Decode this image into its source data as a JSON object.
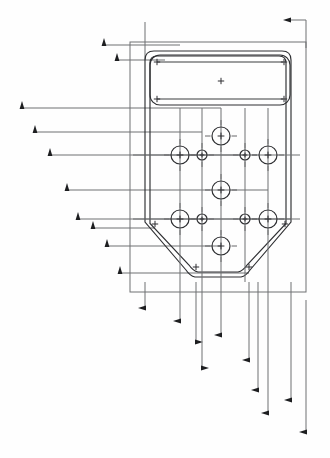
{
  "drawing": {
    "title": "Mounting Plate Hole Pattern Detail",
    "type": "mechanical-engineering-drawing",
    "view": "plan-view",
    "background_color": "#fefefe",
    "line_color": "#6f7073",
    "part_outline_color": "#2e2f32",
    "arrow_color": "#1d1e20",
    "canvas": {
      "width": 330,
      "height": 458
    }
  },
  "part": {
    "name": "tapered-mounting-plate",
    "outer_boundary": {
      "name": "outer-reference-rectangle",
      "x": 130,
      "y": 42,
      "width": 176,
      "height": 250
    },
    "plate_outline": {
      "name": "plate-profile",
      "description": "rounded-top rectangle with chamfered lower corners",
      "top": 51,
      "bottom": 281,
      "left": 145,
      "right": 291,
      "corner_radius": 9,
      "chamfer_start_y": 222,
      "chamfer_bottom_y": 272,
      "chamfer_inset": 45
    },
    "inner_offset_outline": {
      "name": "plate-inner-offset-profile",
      "offset": 5
    }
  },
  "features": {
    "top_slot": {
      "name": "top-rounded-slot",
      "x": 150,
      "y": 55,
      "width": 140,
      "height": 50,
      "corner_radius": 10,
      "inner_line_top_y": 62,
      "inner_line_bottom_y": 99,
      "corner_marks": 4,
      "center_mark": true
    },
    "large_holes": [
      {
        "name": "hole-top-center",
        "cx": 221,
        "cy": 136,
        "r": 9
      },
      {
        "name": "hole-mid-left",
        "cx": 180,
        "cy": 155,
        "r": 9
      },
      {
        "name": "hole-mid-right",
        "cx": 268,
        "cy": 155,
        "r": 9
      },
      {
        "name": "hole-center",
        "cx": 221,
        "cy": 190,
        "r": 9
      },
      {
        "name": "hole-low-left",
        "cx": 180,
        "cy": 219,
        "r": 9
      },
      {
        "name": "hole-low-right",
        "cx": 268,
        "cy": 219,
        "r": 9
      },
      {
        "name": "hole-bottom-center",
        "cx": 221,
        "cy": 246,
        "r": 9
      }
    ],
    "small_holes": [
      {
        "name": "small-hole-mid-left",
        "cx": 202,
        "cy": 155,
        "r": 5
      },
      {
        "name": "small-hole-mid-right",
        "cx": 245,
        "cy": 155,
        "r": 5
      },
      {
        "name": "small-hole-low-left",
        "cx": 202,
        "cy": 219,
        "r": 5
      },
      {
        "name": "small-hole-low-right",
        "cx": 245,
        "cy": 219,
        "r": 5
      }
    ],
    "corner_cross_marks": [
      {
        "name": "cross-slot-tl",
        "x": 157,
        "y": 62
      },
      {
        "name": "cross-slot-tr",
        "x": 284,
        "y": 62
      },
      {
        "name": "cross-slot-c",
        "x": 221,
        "y": 81
      },
      {
        "name": "cross-slot-bl",
        "x": 157,
        "y": 99
      },
      {
        "name": "cross-slot-br",
        "x": 284,
        "y": 99
      },
      {
        "name": "cross-plate-ml",
        "x": 155,
        "y": 224
      },
      {
        "name": "cross-plate-mr",
        "x": 285,
        "y": 224
      },
      {
        "name": "cross-plate-bl",
        "x": 196,
        "y": 267
      },
      {
        "name": "cross-plate-br",
        "x": 249,
        "y": 267
      }
    ]
  },
  "dimensions": {
    "vertical_stack_left": {
      "name": "left-vertical-dimension-lines",
      "description": "horizontal leader lines terminating in upward arrowheads, stacked top to bottom",
      "lines": [
        {
          "name": "dim-v-1",
          "arrow_x": 104,
          "y": 45,
          "to_x": 180
        },
        {
          "name": "dim-v-2",
          "arrow_x": 117,
          "y": 60,
          "to_x": 165
        },
        {
          "name": "dim-v-3",
          "arrow_x": 22,
          "y": 108,
          "to_x": 221
        },
        {
          "name": "dim-v-4",
          "arrow_x": 35,
          "y": 132,
          "to_x": 202
        },
        {
          "name": "dim-v-5",
          "arrow_x": 50,
          "y": 155,
          "to_x": 245
        },
        {
          "name": "dim-v-6",
          "arrow_x": 67,
          "y": 190,
          "to_x": 268
        },
        {
          "name": "dim-v-7",
          "arrow_x": 78,
          "y": 219,
          "to_x": 291
        },
        {
          "name": "dim-v-8",
          "arrow_x": 93,
          "y": 228,
          "to_x": 155
        },
        {
          "name": "dim-v-9",
          "arrow_x": 107,
          "y": 246,
          "to_x": 221
        },
        {
          "name": "dim-v-10",
          "arrow_x": 120,
          "y": 273,
          "to_x": 249
        }
      ]
    },
    "horizontal_stack_bottom": {
      "name": "bottom-horizontal-dimension-lines",
      "description": "vertical leader lines terminating in leftward/rightward arrowheads, stepped down",
      "lines": [
        {
          "name": "dim-h-1",
          "x": 145,
          "arrow_y": 308,
          "from_y": 282,
          "dir": "left"
        },
        {
          "name": "dim-h-2",
          "x": 180,
          "arrow_y": 321,
          "from_y": 282,
          "dir": "left"
        },
        {
          "name": "dim-h-3",
          "x": 196,
          "arrow_y": 342,
          "from_y": 282,
          "dir": "right"
        },
        {
          "name": "dim-h-4",
          "x": 221,
          "arrow_y": 335,
          "from_y": 282,
          "dir": "left"
        },
        {
          "name": "dim-h-5",
          "x": 202,
          "arrow_y": 368,
          "from_y": 282,
          "dir": "right"
        },
        {
          "name": "dim-h-6",
          "x": 249,
          "arrow_y": 360,
          "from_y": 282,
          "dir": "left"
        },
        {
          "name": "dim-h-7",
          "x": 258,
          "arrow_y": 390,
          "from_y": 282,
          "dir": "left"
        },
        {
          "name": "dim-h-8",
          "x": 268,
          "arrow_y": 413,
          "from_y": 282,
          "dir": "left"
        },
        {
          "name": "dim-h-9",
          "x": 291,
          "arrow_y": 400,
          "from_y": 282,
          "dir": "left"
        },
        {
          "name": "dim-h-10",
          "x": 306,
          "arrow_y": 432,
          "from_y": 300,
          "dir": "left"
        }
      ]
    },
    "top_right": {
      "name": "top-right-dimension",
      "arrow_x": 290,
      "y": 20,
      "line_x": 306,
      "line_to_y": 48,
      "dir": "left"
    },
    "top_center": {
      "name": "top-center-extension-line",
      "x": 145,
      "from_y": 22,
      "to_y": 60
    }
  },
  "legend": {
    "notes": []
  }
}
